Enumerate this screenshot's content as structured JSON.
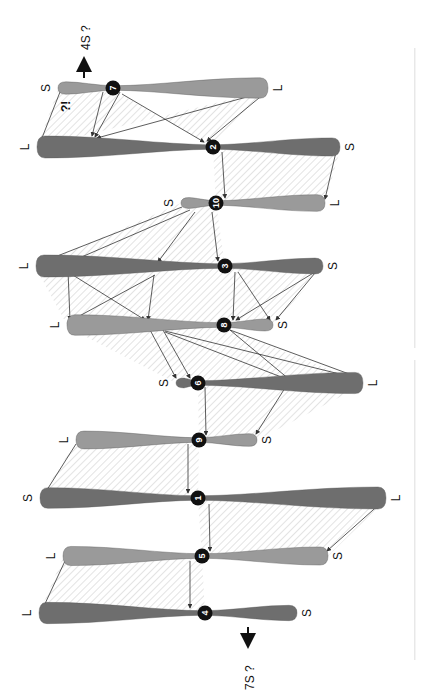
{
  "figure": {
    "type": "chromosome homology / rearrangement diagram (rotated 90°)",
    "colors": {
      "dark_chromosome": "#6e6e6e",
      "light_chromosome": "#9a9a9a",
      "centromere": "#111111",
      "hatch": "#c8c8c8",
      "arrow": "#333333"
    },
    "annotations": {
      "top_arrow_label": "4S ?",
      "bottom_arrow_label": "7S ?",
      "question_mark": "?!"
    },
    "chromosomes": [
      {
        "id": "7",
        "left_label": "S",
        "right_label": "L",
        "y": 88,
        "x1": 58,
        "x2": 268,
        "cx": 113,
        "shade": "light"
      },
      {
        "id": "2",
        "left_label": "L",
        "right_label": "S",
        "y": 147,
        "x1": 37,
        "x2": 340,
        "cx": 213,
        "shade": "dark"
      },
      {
        "id": "10",
        "left_label": "S",
        "right_label": "L",
        "y": 203,
        "x1": 181,
        "x2": 325,
        "cx": 216,
        "shade": "light"
      },
      {
        "id": "3",
        "left_label": "L",
        "right_label": "S",
        "y": 266,
        "x1": 36,
        "x2": 323,
        "cx": 225,
        "shade": "dark"
      },
      {
        "id": "8",
        "left_label": "L",
        "right_label": "S",
        "y": 325,
        "x1": 67,
        "x2": 273,
        "cx": 224,
        "shade": "light"
      },
      {
        "id": "6",
        "left_label": "S",
        "right_label": "L",
        "y": 383,
        "x1": 176,
        "x2": 363,
        "cx": 198,
        "shade": "dark"
      },
      {
        "id": "9",
        "left_label": "L",
        "right_label": "S",
        "y": 440,
        "x1": 76,
        "x2": 257,
        "cx": 199,
        "shade": "light"
      },
      {
        "id": "1",
        "left_label": "S",
        "right_label": "L",
        "y": 498,
        "x1": 40,
        "x2": 386,
        "cx": 198,
        "shade": "dark"
      },
      {
        "id": "5",
        "left_label": "L",
        "right_label": "S",
        "y": 556,
        "x1": 63,
        "x2": 328,
        "cx": 202,
        "shade": "light"
      },
      {
        "id": "4",
        "left_label": "L",
        "right_label": "S",
        "y": 613,
        "x1": 39,
        "x2": 297,
        "cx": 205,
        "shade": "dark"
      }
    ]
  }
}
